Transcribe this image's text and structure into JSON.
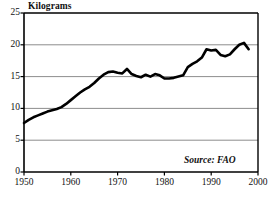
{
  "chart_data": {
    "type": "line",
    "title": "",
    "subtitle": "",
    "ylabel": "Kilograms",
    "xlabel": "",
    "source_note": "Source: FAO",
    "xlim": [
      1950,
      2000
    ],
    "ylim": [
      0,
      25
    ],
    "grid": true,
    "grid_axis": "y",
    "legend": "none",
    "line_color": "#000000",
    "axis_color": "#000000",
    "grid_color": "#808080",
    "background_color": "#ffffff",
    "y_ticks": [
      0,
      5,
      10,
      15,
      20,
      25
    ],
    "y_tick_labels": [
      "0",
      "5",
      "10",
      "15",
      "20",
      "25"
    ],
    "x_ticks": [
      1950,
      1960,
      1970,
      1980,
      1990,
      2000
    ],
    "x_tick_labels": [
      "1950",
      "1960",
      "1970",
      "1980",
      "1990",
      "2000"
    ],
    "x": [
      1950,
      1951,
      1952,
      1953,
      1954,
      1955,
      1956,
      1957,
      1958,
      1959,
      1960,
      1961,
      1962,
      1963,
      1964,
      1965,
      1966,
      1967,
      1968,
      1969,
      1970,
      1971,
      1972,
      1973,
      1974,
      1975,
      1976,
      1977,
      1978,
      1979,
      1980,
      1981,
      1982,
      1983,
      1984,
      1985,
      1986,
      1987,
      1988,
      1989,
      1990,
      1991,
      1992,
      1993,
      1994,
      1995,
      1996,
      1997,
      1998
    ],
    "values": [
      7.7,
      8.2,
      8.6,
      8.9,
      9.2,
      9.5,
      9.7,
      9.9,
      10.2,
      10.7,
      11.3,
      11.9,
      12.5,
      13.0,
      13.4,
      14.0,
      14.7,
      15.3,
      15.7,
      15.8,
      15.6,
      15.5,
      16.2,
      15.4,
      15.1,
      14.9,
      15.3,
      15.0,
      15.4,
      15.2,
      14.7,
      14.7,
      14.8,
      15.0,
      15.2,
      16.5,
      17.0,
      17.4,
      18.0,
      19.3,
      19.1,
      19.2,
      18.4,
      18.2,
      18.5,
      19.3,
      20.0,
      20.3,
      19.3
    ],
    "series_name": "Seafood consumption per person",
    "annotations": []
  },
  "geometry": {
    "plot_left": 24,
    "plot_right": 258,
    "plot_top": 13,
    "plot_bottom": 172
  }
}
